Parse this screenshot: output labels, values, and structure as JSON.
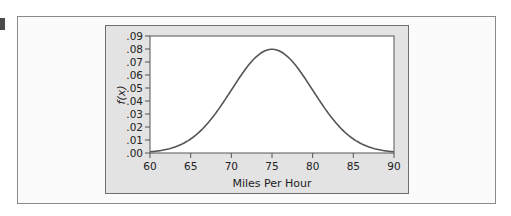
{
  "chart_data": {
    "type": "line",
    "title": "",
    "xlabel": "Miles Per Hour",
    "ylabel": "f(x)",
    "xlim": [
      60,
      90
    ],
    "ylim": [
      0,
      0.09
    ],
    "x_ticks": [
      "60",
      "65",
      "70",
      "75",
      "80",
      "85",
      "90"
    ],
    "y_ticks": [
      ".00",
      ".01",
      ".02",
      ".03",
      ".04",
      ".05",
      ".06",
      ".07",
      ".08",
      ".09"
    ],
    "grid": false,
    "legend": null,
    "series": [
      {
        "name": "Normal density (mean 75, sd 5)",
        "distribution": {
          "type": "normal",
          "mean": 75,
          "sd": 5
        },
        "x": [
          60,
          62.5,
          65,
          67.5,
          70,
          72.5,
          75,
          77.5,
          80,
          82.5,
          85,
          87.5,
          90
        ],
        "values": [
          0.0009,
          0.0035,
          0.0108,
          0.0259,
          0.0484,
          0.0704,
          0.0798,
          0.0704,
          0.0484,
          0.0259,
          0.0108,
          0.0035,
          0.0009
        ]
      }
    ],
    "colors": {
      "line": "#555555",
      "panel": "#e3e3e3",
      "plot_bg": "#ffffff"
    }
  }
}
